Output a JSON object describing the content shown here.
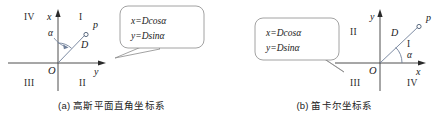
{
  "figure": {
    "background": "#ffffff",
    "accent_color": "#6f7f99",
    "axis_color": "#3a3a3a"
  },
  "panels": [
    {
      "id": "a",
      "caption": "(a) 高斯平面直角坐标系",
      "caption_prefix": "(a)",
      "caption_title": "高斯平面直角坐标系",
      "axes": {
        "vertical_label": "x",
        "horizontal_label": "y",
        "origin_label": "O"
      },
      "quadrants": [
        {
          "name": "upper-left",
          "label": "IV"
        },
        {
          "name": "upper-right",
          "label": "I"
        },
        {
          "name": "lower-left",
          "label": "III"
        },
        {
          "name": "lower-right",
          "label": "II"
        }
      ],
      "point_label": "p",
      "distance_label": "D",
      "angle_label": "α",
      "callout": {
        "line1": "x=Dcosα",
        "line2": "y=Dsinα",
        "tail_direction": "left"
      }
    },
    {
      "id": "b",
      "caption": "(b) 笛卡尔坐标系",
      "caption_prefix": "(b)",
      "caption_title": "笛卡尔坐标系",
      "axes": {
        "vertical_label": "y",
        "horizontal_label": "x",
        "origin_label": "O"
      },
      "quadrants": [
        {
          "name": "upper-left",
          "label": "II"
        },
        {
          "name": "upper-right",
          "label": "I"
        },
        {
          "name": "lower-left",
          "label": "III"
        },
        {
          "name": "lower-right",
          "label": "IV"
        }
      ],
      "point_label": "p",
      "distance_label": "D",
      "angle_label": "α",
      "callout": {
        "line1": "x=Dcosα",
        "line2": "y=Dsinα",
        "tail_direction": "right"
      }
    }
  ]
}
